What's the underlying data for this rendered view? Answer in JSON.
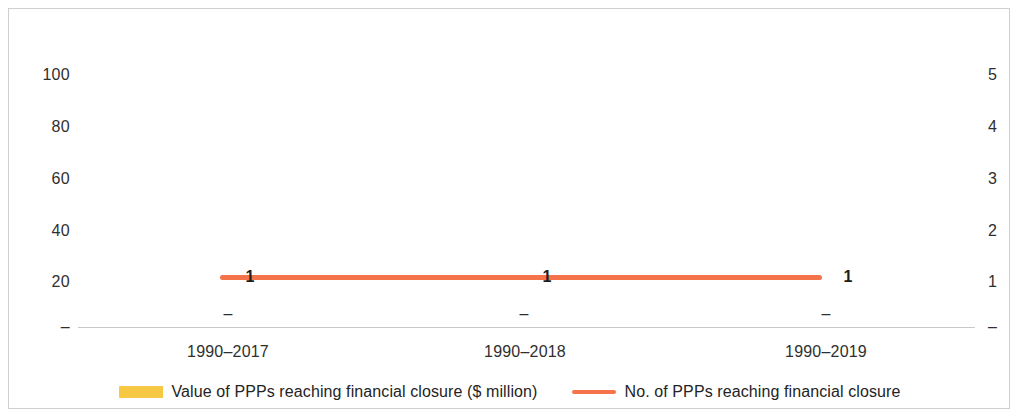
{
  "chart_data": {
    "type": "line",
    "title": "",
    "subtitle": "",
    "xlabel": "",
    "ylabel": "",
    "categories": [
      "1990–2017",
      "1990–2018",
      "1990–2019"
    ],
    "series": [
      {
        "name": "Value of PPPs reaching financial closure ($ million)",
        "type": "bar",
        "axis": "left",
        "color": "#F7C843",
        "values": [
          0,
          0,
          0
        ],
        "value_labels": [
          "–",
          "–",
          "–"
        ]
      },
      {
        "name": "No. of PPPs reaching financial closure",
        "type": "line",
        "axis": "right",
        "color": "#F4734A",
        "values": [
          1,
          1,
          1
        ],
        "value_labels": [
          "1",
          "1",
          "1"
        ]
      }
    ],
    "left_axis": {
      "ticks": [
        "100",
        "80",
        "60",
        "40",
        "20",
        "–"
      ],
      "values": [
        100,
        80,
        60,
        40,
        20,
        0
      ],
      "ylim": [
        0,
        100
      ]
    },
    "right_axis": {
      "ticks": [
        "5",
        "4",
        "3",
        "2",
        "1",
        "–"
      ],
      "values": [
        5,
        4,
        3,
        2,
        1,
        0
      ],
      "ylim": [
        0,
        5
      ]
    },
    "grid": false,
    "legend_position": "bottom"
  },
  "axes": {
    "left_ticks": [
      {
        "label": "100",
        "top": 66
      },
      {
        "label": "80",
        "top": 118
      },
      {
        "label": "60",
        "top": 170
      },
      {
        "label": "40",
        "top": 222
      },
      {
        "label": "20",
        "top": 273
      },
      {
        "label": "–",
        "top": 318
      }
    ],
    "right_ticks": [
      {
        "label": "5",
        "top": 66
      },
      {
        "label": "4",
        "top": 118
      },
      {
        "label": "3",
        "top": 170
      },
      {
        "label": "2",
        "top": 222
      },
      {
        "label": "1",
        "top": 273
      },
      {
        "label": "–",
        "top": 318
      }
    ],
    "categories": [
      {
        "label": "1990–2017",
        "left": 228
      },
      {
        "label": "1990–2018",
        "left": 525
      },
      {
        "label": "1990–2019",
        "left": 826
      }
    ]
  },
  "plot": {
    "line": {
      "left": 220,
      "width": 602,
      "color": "#F4734A"
    },
    "point_labels": [
      {
        "text": "1",
        "left": 250,
        "top": 268
      },
      {
        "text": "1",
        "left": 547,
        "top": 268
      },
      {
        "text": "1",
        "left": 848,
        "top": 268
      }
    ],
    "bar_labels": [
      {
        "text": "–",
        "left": 228,
        "top": 305
      },
      {
        "text": "–",
        "left": 524,
        "top": 305
      },
      {
        "text": "–",
        "left": 826,
        "top": 305
      }
    ]
  },
  "legend": {
    "items": [
      {
        "label": "Value of PPPs reaching financial closure ($ million)",
        "color": "#F7C843",
        "marker": "bar"
      },
      {
        "label": "No. of PPPs reaching financial closure",
        "color": "#F4734A",
        "marker": "line"
      }
    ]
  },
  "colors": {
    "bar_series": "#F7C843",
    "line_series": "#F4734A",
    "axis_line": "#c8c8c8",
    "frame": "#cfcfcf",
    "text": "#2f2f2f"
  }
}
